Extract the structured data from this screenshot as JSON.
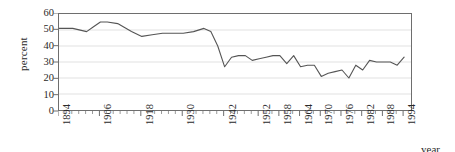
{
  "chart_data": {
    "type": "line",
    "title": "",
    "xlabel": "year",
    "ylabel": "percent",
    "ylim": [
      0,
      60
    ],
    "ytick_values": [
      60,
      50,
      40,
      30,
      20,
      10,
      0
    ],
    "xlim": [
      1894,
      1996
    ],
    "xtick_labels": [
      "1894",
      "1906",
      "1918",
      "1930",
      "1942",
      "1952",
      "1958",
      "1964",
      "1970",
      "1976",
      "1982",
      "1988",
      "1994"
    ],
    "xtick_years": [
      1894,
      1906,
      1918,
      1930,
      1942,
      1952,
      1958,
      1964,
      1970,
      1976,
      1982,
      1988,
      1994
    ],
    "grid": "horizontal",
    "legend": "none",
    "line_color": "#555555",
    "frame_color": "#6e6e6e",
    "grid_color": "#d9d9d9",
    "series": [
      {
        "name": "percent",
        "x": [
          1894,
          1898,
          1902,
          1904,
          1906,
          1908,
          1910,
          1914,
          1918,
          1922,
          1924,
          1926,
          1928,
          1930,
          1932,
          1934,
          1936,
          1938,
          1940,
          1942,
          1944,
          1946,
          1948,
          1950,
          1952,
          1954,
          1956,
          1958,
          1960,
          1962,
          1964,
          1966,
          1968,
          1970,
          1972,
          1974,
          1976,
          1978,
          1980,
          1982,
          1984,
          1986,
          1988,
          1990,
          1992,
          1994
        ],
        "values": [
          51,
          51,
          49,
          52,
          55,
          55,
          54,
          49,
          46,
          47,
          48,
          48,
          48,
          49,
          51,
          49,
          44,
          38,
          31,
          27,
          33,
          34,
          34,
          31,
          32,
          33,
          34,
          34,
          29,
          32,
          34,
          30,
          27,
          28,
          28,
          26,
          22,
          21,
          23,
          24,
          25,
          20,
          28,
          30,
          25,
          30
        ],
        "values_tail": [
          31,
          30,
          30,
          30,
          29,
          28,
          33
        ]
      }
    ],
    "points": [
      {
        "year": 1894,
        "value": 51
      },
      {
        "year": 1898,
        "value": 51
      },
      {
        "year": 1902,
        "value": 49
      },
      {
        "year": 1904,
        "value": 52
      },
      {
        "year": 1906,
        "value": 55
      },
      {
        "year": 1908,
        "value": 55
      },
      {
        "year": 1911,
        "value": 54
      },
      {
        "year": 1915,
        "value": 49
      },
      {
        "year": 1918,
        "value": 46
      },
      {
        "year": 1921,
        "value": 47
      },
      {
        "year": 1924,
        "value": 48
      },
      {
        "year": 1927,
        "value": 48
      },
      {
        "year": 1930,
        "value": 48
      },
      {
        "year": 1933,
        "value": 49
      },
      {
        "year": 1936,
        "value": 51
      },
      {
        "year": 1938,
        "value": 49
      },
      {
        "year": 1940,
        "value": 40
      },
      {
        "year": 1942,
        "value": 27
      },
      {
        "year": 1944,
        "value": 33
      },
      {
        "year": 1946,
        "value": 34
      },
      {
        "year": 1948,
        "value": 34
      },
      {
        "year": 1950,
        "value": 31
      },
      {
        "year": 1952,
        "value": 32
      },
      {
        "year": 1954,
        "value": 33
      },
      {
        "year": 1956,
        "value": 34
      },
      {
        "year": 1958,
        "value": 34
      },
      {
        "year": 1960,
        "value": 29
      },
      {
        "year": 1962,
        "value": 34
      },
      {
        "year": 1964,
        "value": 27
      },
      {
        "year": 1966,
        "value": 28
      },
      {
        "year": 1968,
        "value": 28
      },
      {
        "year": 1970,
        "value": 21
      },
      {
        "year": 1972,
        "value": 23
      },
      {
        "year": 1974,
        "value": 24
      },
      {
        "year": 1976,
        "value": 25
      },
      {
        "year": 1978,
        "value": 20
      },
      {
        "year": 1980,
        "value": 28
      },
      {
        "year": 1982,
        "value": 25
      },
      {
        "year": 1984,
        "value": 31
      },
      {
        "year": 1986,
        "value": 30
      },
      {
        "year": 1988,
        "value": 30
      },
      {
        "year": 1990,
        "value": 30
      },
      {
        "year": 1992,
        "value": 28
      },
      {
        "year": 1994,
        "value": 33
      }
    ]
  }
}
